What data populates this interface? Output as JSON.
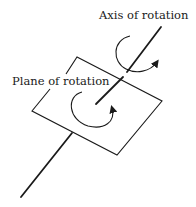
{
  "diagram": {
    "labels": {
      "axis": "Axis of rotation",
      "plane": "Plane of rotation"
    },
    "colors": {
      "stroke": "#1a1a1a",
      "background": "#ffffff"
    }
  }
}
